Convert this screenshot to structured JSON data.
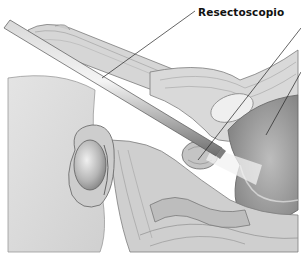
{
  "figure": {
    "type": "medical-illustration",
    "style": "grayscale pencil drawing",
    "labels": [
      {
        "text": "Resectoscopio",
        "target": "resectoscope"
      }
    ],
    "unlabeled_leader_lines": 2
  },
  "colors": {
    "background": "#ffffff",
    "label_text": "#111111",
    "tissue_light": "#e6e6e6",
    "tissue_mid": "#c8c8c8",
    "tissue_dark": "#8a8a8a",
    "instrument": "#9a9a9a"
  }
}
